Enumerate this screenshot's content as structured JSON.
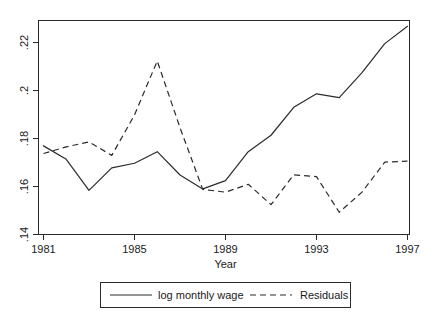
{
  "chart_data": {
    "type": "line",
    "title": "",
    "xlabel": "Year",
    "ylabel": "",
    "xlim": [
      1981,
      1997
    ],
    "ylim": [
      0.14,
      0.2325
    ],
    "grid": false,
    "legend_position": "bottom",
    "xticks": [
      "1981",
      "1985",
      "1989",
      "1993",
      "1997"
    ],
    "xtick_values": [
      1981,
      1985,
      1989,
      1993,
      1997
    ],
    "yticks": [
      ".14",
      ".16",
      ".18",
      ".2",
      ".22"
    ],
    "ytick_values": [
      0.14,
      0.16,
      0.18,
      0.2,
      0.22
    ],
    "x": [
      1981,
      1982,
      1983,
      1984,
      1985,
      1986,
      1987,
      1988,
      1989,
      1990,
      1991,
      1992,
      1993,
      1994,
      1995,
      1996,
      1997
    ],
    "series": [
      {
        "name": "log monthly wage",
        "style": "solid",
        "values": [
          0.1783,
          0.1725,
          0.1591,
          0.1688,
          0.1708,
          0.1758,
          0.1657,
          0.1597,
          0.1633,
          0.1758,
          0.1829,
          0.195,
          0.2008,
          0.1992,
          0.21,
          0.2225,
          0.23
        ]
      },
      {
        "name": "Residuals",
        "style": "dashed",
        "values": [
          0.175,
          0.1779,
          0.18,
          0.1742,
          0.1917,
          0.215,
          0.1862,
          0.1595,
          0.1583,
          0.1617,
          0.1529,
          0.1658,
          0.165,
          0.1496,
          0.1583,
          0.1713,
          0.1717
        ]
      }
    ]
  },
  "legend": {
    "items": [
      {
        "label": "log monthly wage",
        "style": "solid"
      },
      {
        "label": "Residuals",
        "style": "dashed"
      }
    ]
  },
  "axis": {
    "x_title": "Year"
  }
}
